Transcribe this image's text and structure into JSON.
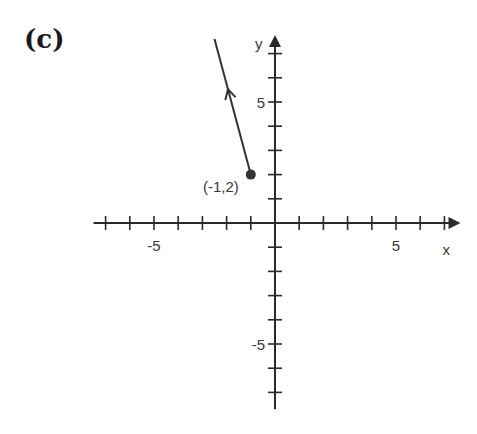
{
  "panel": {
    "label": "(c)"
  },
  "chart_data": {
    "type": "line",
    "title": "",
    "xlabel": "x",
    "ylabel": "y",
    "xlim": [
      -7.5,
      7.5
    ],
    "ylim": [
      -7.7,
      7.6
    ],
    "grid": false,
    "x_tick_labels": [
      {
        "value": -5,
        "label": "-5"
      },
      {
        "value": 5,
        "label": "5"
      }
    ],
    "y_tick_labels": [
      {
        "value": 5,
        "label": "5"
      },
      {
        "value": -5,
        "label": "-5"
      }
    ],
    "series": [
      {
        "name": "ray",
        "points": [
          {
            "x": -1,
            "y": 2
          },
          {
            "x": -2.5,
            "y": 7.6
          }
        ],
        "start_point": {
          "x": -1,
          "y": 2,
          "closed": true
        },
        "direction_arrow": "up-left"
      }
    ],
    "annotations": [
      {
        "text": "(-1,2)",
        "x": -1,
        "y": 2,
        "position": "left"
      }
    ],
    "colors": {
      "axis": "#2a2a2a",
      "line": "#333333",
      "text": "#3a3a3a"
    }
  }
}
